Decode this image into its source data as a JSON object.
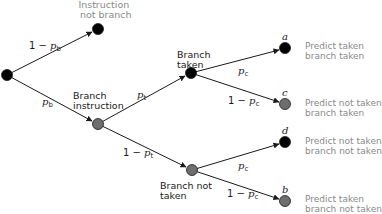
{
  "colors": {
    "black_node": "#000000",
    "grey_node": "#6e6e6e",
    "edge": "#1a1a1a",
    "label_grey": "#8a8a8a"
  },
  "nodes": {
    "root": {
      "x": 7,
      "y": 75,
      "fill": "black"
    },
    "not_branch": {
      "x": 98,
      "y": 29,
      "fill": "black",
      "label_line1": "Instruction",
      "label_line2": "not branch"
    },
    "branch_instr": {
      "x": 98,
      "y": 124,
      "fill": "grey",
      "label_line1": "Branch",
      "label_line2": "instruction"
    },
    "taken": {
      "x": 191,
      "y": 73,
      "fill": "black",
      "label_line1": "Branch",
      "label_line2": "taken"
    },
    "not_taken": {
      "x": 192,
      "y": 170,
      "fill": "grey",
      "label_line1": "Branch not",
      "label_line2": "taken"
    },
    "a": {
      "x": 285,
      "y": 48,
      "fill": "black",
      "letter": "a"
    },
    "c": {
      "x": 285,
      "y": 104,
      "fill": "grey",
      "letter": "c"
    },
    "d": {
      "x": 285,
      "y": 142,
      "fill": "black",
      "letter": "d"
    },
    "b": {
      "x": 285,
      "y": 201,
      "fill": "grey",
      "letter": "b"
    }
  },
  "edges": {
    "root_not_branch": {
      "prefix": "1 − ",
      "var": "p",
      "sub": "b"
    },
    "root_branch": {
      "prefix": "",
      "var": "p",
      "sub": "b"
    },
    "branch_taken": {
      "prefix": "",
      "var": "p",
      "sub": "t"
    },
    "branch_not_taken": {
      "prefix": "1 − ",
      "var": "p",
      "sub": "t"
    },
    "taken_a": {
      "prefix": "",
      "var": "p",
      "sub": "c"
    },
    "taken_c": {
      "prefix": "1 − ",
      "var": "p",
      "sub": "c"
    },
    "not_taken_d": {
      "prefix": "",
      "var": "p",
      "sub": "c"
    },
    "not_taken_b": {
      "prefix": "1 − ",
      "var": "p",
      "sub": "c"
    }
  },
  "outcomes": {
    "a": {
      "line1": "Predict taken",
      "line2": "branch taken"
    },
    "c": {
      "line1": "Predict not taken",
      "line2": "branch taken"
    },
    "d": {
      "line1": "Predict not taken",
      "line2": "branch not taken"
    },
    "b": {
      "line1": "Predict taken",
      "line2": "branch not taken"
    }
  }
}
